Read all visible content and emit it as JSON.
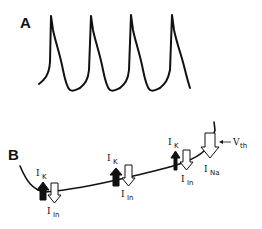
{
  "panels": {
    "a": {
      "label": "A",
      "description": "Repetitive action potential trace (4 spikes)",
      "spike_count": 4
    },
    "b": {
      "label": "B",
      "description": "Pacemaker depolarization with opposing currents",
      "current_labels": [
        {
          "symbol": "I",
          "subscript": "K"
        },
        {
          "symbol": "I",
          "subscript": "In"
        },
        {
          "symbol": "I",
          "subscript": "K"
        },
        {
          "symbol": "I",
          "subscript": "In"
        },
        {
          "symbol": "I",
          "subscript": "K"
        },
        {
          "symbol": "I",
          "subscript": "In"
        },
        {
          "symbol": "I",
          "subscript": "Na"
        }
      ],
      "threshold_label": {
        "symbol": "V",
        "subscript": "th"
      }
    }
  },
  "colors": {
    "line": "#111111",
    "filled_arrow": "#111111",
    "hollow_arrow": "#ffffff"
  }
}
